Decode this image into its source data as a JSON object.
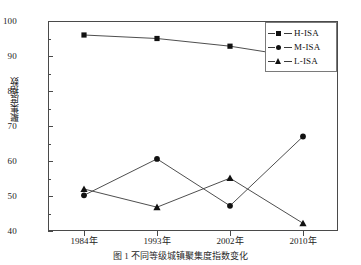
{
  "chart_data": {
    "type": "line",
    "title": "",
    "xlabel": "",
    "ylabel": "聚集度指数",
    "categories": [
      "1984年",
      "1993年",
      "2002年",
      "2010年"
    ],
    "ylim": [
      40,
      100
    ],
    "yticks": [
      40,
      50,
      60,
      70,
      80,
      90,
      100
    ],
    "ytick_labels": [
      "40",
      "50",
      "60",
      "70",
      "80",
      "90",
      "100"
    ],
    "yminor_ticks": [
      45,
      55,
      65,
      75,
      85,
      95
    ],
    "grid": false,
    "legend_position": "upper right",
    "series": [
      {
        "name": "H-ISA",
        "marker": "square",
        "values": [
          96.0,
          95.0,
          92.8,
          89.5
        ]
      },
      {
        "name": "M-ISA",
        "marker": "circle",
        "values": [
          50.2,
          60.6,
          47.2,
          67.0
        ]
      },
      {
        "name": "L-ISA",
        "marker": "triangle",
        "values": [
          52.0,
          46.8,
          55.1,
          42.2
        ]
      }
    ]
  },
  "legend": {
    "items": [
      {
        "label": "H-ISA",
        "marker": "square-marker-icon"
      },
      {
        "label": "M-ISA",
        "marker": "circle-marker-icon"
      },
      {
        "label": "L-ISA",
        "marker": "triangle-marker-icon"
      }
    ]
  },
  "axis": {
    "y_label": "聚集度指数",
    "y_tick_labels": [
      "100",
      "90",
      "80",
      "70",
      "60",
      "50",
      "40"
    ],
    "x_tick_labels": [
      "1984年",
      "1993年",
      "2002年",
      "2010年"
    ]
  },
  "caption": {
    "text": "图 1  不同等级城镇聚集度指数变化"
  },
  "colors": {
    "line": "#3a3a3a",
    "marker": "#111111",
    "frame": "#4a4a4a",
    "text": "#1a1a1a"
  }
}
